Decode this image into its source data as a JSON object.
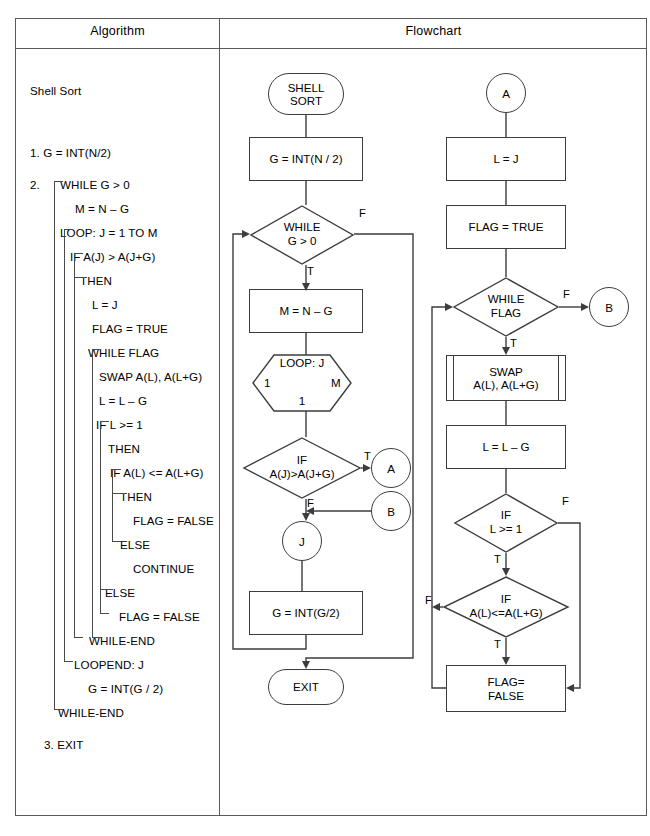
{
  "table": {
    "headers": {
      "algorithm": "Algorithm",
      "flowchart": "Flowchart"
    }
  },
  "algorithm": {
    "title": "Shell Sort",
    "lines": [
      {
        "n": 1,
        "text": "1. G = INT(N/2)"
      },
      {
        "n": 2,
        "text": "2."
      },
      {
        "n": 3,
        "text": "WHILE G > 0"
      },
      {
        "n": 4,
        "text": "M = N – G"
      },
      {
        "n": 5,
        "text": "LOOP: J = 1 TO M"
      },
      {
        "n": 6,
        "text": "IF A(J) > A(J+G)"
      },
      {
        "n": 7,
        "text": "THEN"
      },
      {
        "n": 8,
        "text": "L = J"
      },
      {
        "n": 9,
        "text": "FLAG = TRUE"
      },
      {
        "n": 10,
        "text": "WHILE FLAG"
      },
      {
        "n": 11,
        "text": "SWAP A(L), A(L+G)"
      },
      {
        "n": 12,
        "text": "L = L – G"
      },
      {
        "n": 13,
        "text": "IF L >= 1"
      },
      {
        "n": 14,
        "text": "THEN"
      },
      {
        "n": 15,
        "text": "IF A(L) <= A(L+G)"
      },
      {
        "n": 16,
        "text": "THEN"
      },
      {
        "n": 17,
        "text": "FLAG = FALSE"
      },
      {
        "n": 18,
        "text": "ELSE"
      },
      {
        "n": 19,
        "text": "CONTINUE"
      },
      {
        "n": 20,
        "text": "ELSE"
      },
      {
        "n": 21,
        "text": "FLAG = FALSE"
      },
      {
        "n": 22,
        "text": "WHILE-END"
      },
      {
        "n": 23,
        "text": "LOOPEND: J"
      },
      {
        "n": 24,
        "text": "G = INT(G / 2)"
      },
      {
        "n": 25,
        "text": "WHILE-END"
      },
      {
        "n": 26,
        "text": "3. EXIT"
      }
    ]
  },
  "flowchart": {
    "middle": {
      "start": {
        "text": "SHELL\nSORT",
        "shape": "terminator"
      },
      "init_g": {
        "text": "G = INT(N / 2)",
        "shape": "process"
      },
      "while_g": {
        "text": "WHILE\nG > 0",
        "shape": "decision"
      },
      "while_g_true": "T",
      "while_g_false": "F",
      "set_m": {
        "text": "M = N – G",
        "shape": "process"
      },
      "loop": {
        "shape": "hexagon",
        "top": "LOOP: J",
        "left": "1",
        "right": "M",
        "bottom": "1"
      },
      "if_aj": {
        "text": "IF\nA(J)>A(J+G)",
        "shape": "decision"
      },
      "if_aj_true": "T",
      "if_aj_false": "F",
      "conn_a": {
        "text": "A",
        "shape": "connector"
      },
      "conn_b": {
        "text": "B",
        "shape": "connector"
      },
      "conn_j": {
        "text": "J",
        "shape": "connector"
      },
      "halve_g": {
        "text": "G = INT(G/2)",
        "shape": "process"
      },
      "exit": {
        "text": "EXIT",
        "shape": "terminator"
      }
    },
    "right": {
      "conn_a": {
        "text": "A",
        "shape": "connector"
      },
      "set_l": {
        "text": "L = J",
        "shape": "process"
      },
      "flag_true": {
        "text": "FLAG = TRUE",
        "shape": "process"
      },
      "while_flag": {
        "text": "WHILE\nFLAG",
        "shape": "decision"
      },
      "while_flag_true": "T",
      "while_flag_false": "F",
      "conn_b": {
        "text": "B",
        "shape": "connector"
      },
      "swap": {
        "text": "SWAP\nA(L), A(L+G)",
        "shape": "predefined-process"
      },
      "dec_l": {
        "text": "L = L – G",
        "shape": "process"
      },
      "if_l": {
        "text": "IF\nL >= 1",
        "shape": "decision"
      },
      "if_l_true": "T",
      "if_l_false": "F",
      "if_al": {
        "text": "IF\nA(L)<=A(L+G)",
        "shape": "decision"
      },
      "if_al_true": "T",
      "if_al_false": "F",
      "flag_false": {
        "text": "FLAG=\nFALSE",
        "shape": "process"
      }
    }
  },
  "colors": {
    "line": "#3c3c3c",
    "frame": "#5a5a5a",
    "text": "#000000",
    "background": "#ffffff"
  }
}
